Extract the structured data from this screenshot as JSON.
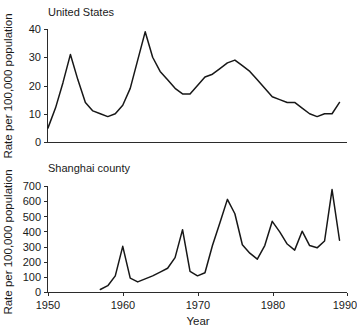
{
  "figure": {
    "background_color": "#ffffff",
    "line_color": "#171717",
    "axis_color": "#2b2b2b"
  },
  "labels": {
    "panel_top_title": "United States",
    "panel_bottom_title": "Shanghai county",
    "ylabel": "Rate per 100,000 population",
    "xlabel": "Year"
  },
  "chart_data": [
    {
      "type": "line",
      "title": "United States",
      "xlabel": "",
      "ylabel": "Rate per 100,000 population",
      "xlim": [
        1950,
        1990
      ],
      "ylim": [
        0,
        40
      ],
      "xticks": [
        1950,
        1960,
        1970,
        1980,
        1990
      ],
      "yticks": [
        0,
        10,
        20,
        30,
        40
      ],
      "grid": false,
      "legend": "none",
      "x": [
        1950,
        1951,
        1952,
        1953,
        1954,
        1955,
        1956,
        1957,
        1958,
        1959,
        1960,
        1961,
        1962,
        1963,
        1964,
        1965,
        1966,
        1967,
        1968,
        1969,
        1970,
        1971,
        1972,
        1973,
        1974,
        1975,
        1976,
        1977,
        1978,
        1979,
        1980,
        1981,
        1982,
        1983,
        1984,
        1985,
        1986,
        1987,
        1988,
        1989
      ],
      "values": [
        5,
        12,
        21,
        31,
        22,
        14,
        11,
        10,
        9,
        10,
        13,
        19,
        29,
        39,
        30,
        25,
        22,
        19,
        17,
        17,
        20,
        23,
        24,
        26,
        28,
        29,
        27,
        25,
        22,
        19,
        16,
        15,
        14,
        14,
        12,
        10,
        9,
        10,
        10,
        14
      ]
    },
    {
      "type": "line",
      "title": "Shanghai county",
      "xlabel": "Year",
      "ylabel": "Rate per 100,000 population",
      "xlim": [
        1950,
        1990
      ],
      "ylim": [
        0,
        700
      ],
      "xticks": [
        1950,
        1960,
        1970,
        1980,
        1990
      ],
      "yticks": [
        0,
        100,
        200,
        300,
        400,
        500,
        600,
        700
      ],
      "grid": false,
      "legend": "none",
      "x": [
        1957,
        1958,
        1959,
        1960,
        1961,
        1962,
        1963,
        1964,
        1965,
        1966,
        1967,
        1968,
        1969,
        1970,
        1971,
        1972,
        1973,
        1974,
        1975,
        1976,
        1977,
        1978,
        1979,
        1980,
        1981,
        1982,
        1983,
        1984,
        1985,
        1986,
        1987,
        1988,
        1989
      ],
      "values": [
        20,
        45,
        110,
        305,
        95,
        70,
        90,
        110,
        135,
        160,
        230,
        415,
        140,
        110,
        130,
        310,
        460,
        615,
        520,
        315,
        260,
        220,
        310,
        470,
        400,
        320,
        280,
        405,
        310,
        295,
        340,
        680,
        345
      ]
    }
  ]
}
